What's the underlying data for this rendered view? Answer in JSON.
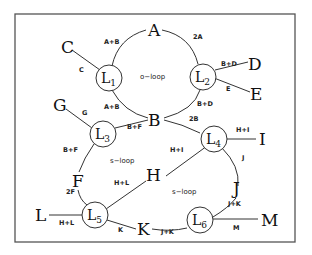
{
  "diagram": {
    "type": "loop-network",
    "frame": true,
    "letter_nodes": {
      "A": "A",
      "B": "B",
      "C": "C",
      "D": "D",
      "E": "E",
      "F": "F",
      "G": "G",
      "H": "H",
      "I": "I",
      "J": "J",
      "K": "K",
      "L": "L",
      "M": "M"
    },
    "loop_nodes": [
      {
        "id": "L1",
        "base": "L",
        "sub": "1"
      },
      {
        "id": "L2",
        "base": "L",
        "sub": "2"
      },
      {
        "id": "L3",
        "base": "L",
        "sub": "3"
      },
      {
        "id": "L4",
        "base": "L",
        "sub": "4"
      },
      {
        "id": "L5",
        "base": "L",
        "sub": "5"
      },
      {
        "id": "L6",
        "base": "L",
        "sub": "6"
      }
    ],
    "loop_labels": {
      "o_loop": "o−loop",
      "s_loop_upper": "s−loop",
      "s_loop_lower": "s−loop"
    },
    "edge_labels": {
      "A_L1": "A+B",
      "A_L2": "2A",
      "C_L1": "C",
      "L1_B": "A+B",
      "L2_D": "B+D",
      "L2_E": "E",
      "L2_B": "B+D",
      "G_L3": "G",
      "B_L3": "B+F",
      "B_L4": "2B",
      "L4_I": "H+I",
      "L3_F": "B+F",
      "L4_H": "H+I",
      "L4_J": "J",
      "F_L5": "2F",
      "H_L5": "H+L",
      "L_L5": "H+L",
      "L5_K": "K",
      "J_L6": "J+K",
      "K_L6": "J+K",
      "L6_M": "M"
    },
    "edges": [
      [
        "L1",
        "A"
      ],
      [
        "A",
        "L2"
      ],
      [
        "C",
        "L1"
      ],
      [
        "L1",
        "B"
      ],
      [
        "L2",
        "B"
      ],
      [
        "L2",
        "D"
      ],
      [
        "L2",
        "E"
      ],
      [
        "G",
        "L3"
      ],
      [
        "L3",
        "B"
      ],
      [
        "B",
        "L4"
      ],
      [
        "L4",
        "I"
      ],
      [
        "L3",
        "F"
      ],
      [
        "F",
        "L5"
      ],
      [
        "L4",
        "H"
      ],
      [
        "H",
        "L5"
      ],
      [
        "L4",
        "J"
      ],
      [
        "J",
        "L6"
      ],
      [
        "L",
        "L5"
      ],
      [
        "L5",
        "K"
      ],
      [
        "K",
        "L6"
      ],
      [
        "L6",
        "M"
      ]
    ]
  }
}
